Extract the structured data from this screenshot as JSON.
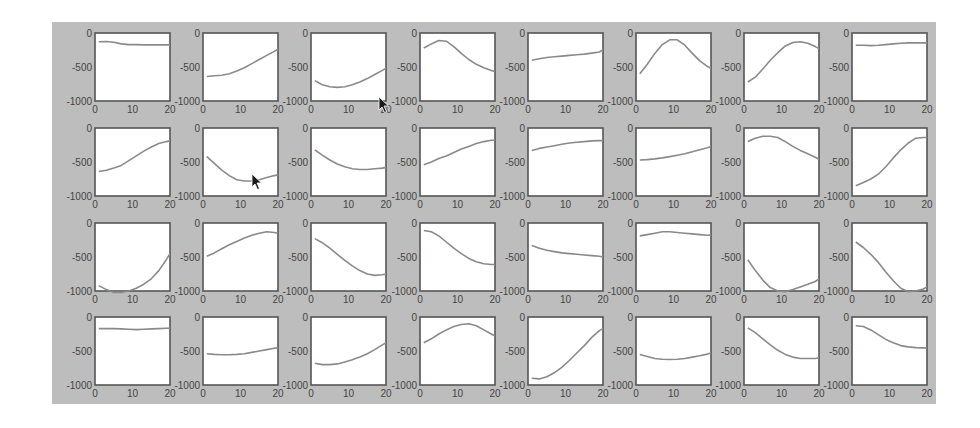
{
  "figure": {
    "panel_color": "#bdbdbd",
    "axes_bg": "#ffffff",
    "axes_border": "#555555",
    "line_color": "#8a8a8a",
    "tick_color": "#444444"
  },
  "chart_data": {
    "type": "line",
    "layout": {
      "rows": 4,
      "cols": 8,
      "grid": false,
      "legend": "none"
    },
    "title": "",
    "xlabel": "",
    "ylabel": "",
    "xlim": [
      0,
      20
    ],
    "ylim": [
      -1000,
      0
    ],
    "xticks": [
      "0",
      "10",
      "20"
    ],
    "yticks": [
      "0",
      "-500",
      "-1000"
    ],
    "x": [
      1,
      3,
      5,
      7,
      9,
      11,
      13,
      15,
      17,
      19,
      20
    ],
    "subplots": [
      {
        "row": 1,
        "col": 1,
        "values": [
          -130,
          -125,
          -135,
          -160,
          -170,
          -170,
          -175,
          -175,
          -175,
          -175,
          -175
        ]
      },
      {
        "row": 1,
        "col": 2,
        "values": [
          -640,
          -630,
          -620,
          -600,
          -560,
          -510,
          -450,
          -390,
          -330,
          -270,
          -240
        ]
      },
      {
        "row": 1,
        "col": 3,
        "values": [
          -700,
          -760,
          -790,
          -800,
          -790,
          -760,
          -720,
          -670,
          -610,
          -550,
          -520
        ]
      },
      {
        "row": 1,
        "col": 4,
        "values": [
          -220,
          -160,
          -110,
          -120,
          -200,
          -300,
          -390,
          -460,
          -510,
          -550,
          -570
        ]
      },
      {
        "row": 1,
        "col": 5,
        "values": [
          -400,
          -380,
          -360,
          -350,
          -340,
          -330,
          -320,
          -310,
          -295,
          -280,
          -250
        ]
      },
      {
        "row": 1,
        "col": 6,
        "values": [
          -600,
          -460,
          -300,
          -170,
          -100,
          -100,
          -180,
          -300,
          -410,
          -490,
          -520
        ]
      },
      {
        "row": 1,
        "col": 7,
        "values": [
          -720,
          -650,
          -530,
          -400,
          -290,
          -190,
          -140,
          -130,
          -150,
          -200,
          -230
        ]
      },
      {
        "row": 1,
        "col": 8,
        "values": [
          -180,
          -180,
          -185,
          -180,
          -170,
          -160,
          -150,
          -145,
          -145,
          -145,
          -145
        ]
      },
      {
        "row": 2,
        "col": 1,
        "values": [
          -640,
          -620,
          -590,
          -550,
          -480,
          -410,
          -340,
          -280,
          -230,
          -200,
          -190
        ]
      },
      {
        "row": 2,
        "col": 2,
        "values": [
          -420,
          -520,
          -620,
          -700,
          -760,
          -780,
          -780,
          -760,
          -730,
          -700,
          -690
        ]
      },
      {
        "row": 2,
        "col": 3,
        "values": [
          -320,
          -400,
          -470,
          -530,
          -570,
          -600,
          -610,
          -610,
          -600,
          -590,
          -580
        ]
      },
      {
        "row": 2,
        "col": 4,
        "values": [
          -540,
          -500,
          -450,
          -410,
          -360,
          -310,
          -270,
          -230,
          -200,
          -180,
          -180
        ]
      },
      {
        "row": 2,
        "col": 5,
        "values": [
          -330,
          -300,
          -280,
          -260,
          -240,
          -220,
          -210,
          -200,
          -190,
          -185,
          -185
        ]
      },
      {
        "row": 2,
        "col": 6,
        "values": [
          -470,
          -465,
          -455,
          -440,
          -420,
          -400,
          -380,
          -350,
          -320,
          -290,
          -270
        ]
      },
      {
        "row": 2,
        "col": 7,
        "values": [
          -200,
          -150,
          -120,
          -120,
          -140,
          -200,
          -270,
          -330,
          -380,
          -430,
          -460
        ]
      },
      {
        "row": 2,
        "col": 8,
        "values": [
          -850,
          -800,
          -750,
          -680,
          -570,
          -440,
          -320,
          -220,
          -150,
          -140,
          -140
        ]
      },
      {
        "row": 3,
        "col": 1,
        "values": [
          -920,
          -980,
          -1020,
          -1020,
          -1000,
          -960,
          -900,
          -820,
          -700,
          -540,
          -450
        ]
      },
      {
        "row": 3,
        "col": 2,
        "values": [
          -490,
          -440,
          -380,
          -320,
          -270,
          -220,
          -180,
          -150,
          -130,
          -140,
          -150
        ]
      },
      {
        "row": 3,
        "col": 3,
        "values": [
          -230,
          -290,
          -370,
          -460,
          -550,
          -630,
          -700,
          -750,
          -770,
          -760,
          -750
        ]
      },
      {
        "row": 3,
        "col": 4,
        "values": [
          -110,
          -130,
          -190,
          -280,
          -370,
          -450,
          -520,
          -570,
          -600,
          -610,
          -610
        ]
      },
      {
        "row": 3,
        "col": 5,
        "values": [
          -330,
          -370,
          -400,
          -420,
          -440,
          -450,
          -460,
          -470,
          -480,
          -490,
          -500
        ]
      },
      {
        "row": 3,
        "col": 6,
        "values": [
          -190,
          -170,
          -150,
          -130,
          -130,
          -140,
          -150,
          -160,
          -170,
          -180,
          -175
        ]
      },
      {
        "row": 3,
        "col": 7,
        "values": [
          -540,
          -700,
          -840,
          -950,
          -1000,
          -1010,
          -980,
          -940,
          -900,
          -860,
          -820
        ]
      },
      {
        "row": 3,
        "col": 8,
        "values": [
          -280,
          -360,
          -460,
          -580,
          -720,
          -850,
          -960,
          -1010,
          -1000,
          -970,
          -940
        ]
      },
      {
        "row": 4,
        "col": 1,
        "values": [
          -170,
          -170,
          -170,
          -175,
          -180,
          -185,
          -180,
          -175,
          -170,
          -165,
          -165
        ]
      },
      {
        "row": 4,
        "col": 2,
        "values": [
          -540,
          -550,
          -555,
          -555,
          -550,
          -540,
          -520,
          -500,
          -480,
          -460,
          -450
        ]
      },
      {
        "row": 4,
        "col": 3,
        "values": [
          -680,
          -700,
          -700,
          -690,
          -660,
          -630,
          -590,
          -540,
          -480,
          -410,
          -380
        ]
      },
      {
        "row": 4,
        "col": 4,
        "values": [
          -380,
          -320,
          -250,
          -190,
          -140,
          -110,
          -100,
          -130,
          -190,
          -250,
          -280
        ]
      },
      {
        "row": 4,
        "col": 5,
        "values": [
          -900,
          -910,
          -880,
          -820,
          -740,
          -640,
          -530,
          -420,
          -300,
          -200,
          -170
        ]
      },
      {
        "row": 4,
        "col": 6,
        "values": [
          -550,
          -580,
          -610,
          -620,
          -625,
          -620,
          -610,
          -590,
          -570,
          -545,
          -530
        ]
      },
      {
        "row": 4,
        "col": 7,
        "values": [
          -160,
          -230,
          -320,
          -410,
          -490,
          -550,
          -590,
          -610,
          -610,
          -610,
          -600
        ]
      },
      {
        "row": 4,
        "col": 8,
        "values": [
          -130,
          -140,
          -190,
          -260,
          -330,
          -380,
          -420,
          -440,
          -450,
          -455,
          -455
        ]
      }
    ]
  },
  "cursors": [
    {
      "x": 378,
      "y": 96
    },
    {
      "x": 251,
      "y": 173
    }
  ]
}
